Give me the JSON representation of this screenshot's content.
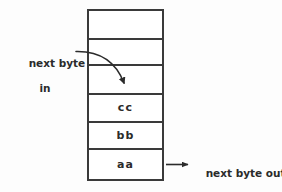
{
  "diagram": {
    "stack": {
      "name": "byte-stack",
      "cells": [
        {
          "label": ""
        },
        {
          "label": ""
        },
        {
          "label": ""
        },
        {
          "label": "cc"
        },
        {
          "label": "bb"
        },
        {
          "label": "aa"
        }
      ]
    },
    "annotations": {
      "input": {
        "line1": "next byte",
        "line2": "in"
      },
      "output": {
        "line1": "next byte out",
        "line2": "is aa."
      }
    },
    "colors": {
      "stroke": "#3a3a3a",
      "text": "#2b2b2b",
      "background": "#fdfdfd",
      "cell_fill": "#ffffff"
    }
  }
}
